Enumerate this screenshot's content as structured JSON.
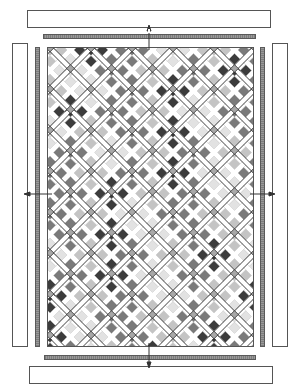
{
  "diagram": {
    "title": "",
    "type": "quilt-assembly-diagram",
    "layout": "on-point blocks with sashing and cornerstones, surrounded by inner strips and outer border panels",
    "components": {
      "top_border": {
        "label": ""
      },
      "bottom_border": {
        "label": ""
      },
      "left_border": {
        "label": ""
      },
      "right_border": {
        "label": ""
      },
      "top_inner_strip": {
        "label": ""
      },
      "bottom_inner_strip": {
        "label": ""
      },
      "left_inner_strip": {
        "label": ""
      },
      "right_inner_strip": {
        "label": ""
      },
      "quilt_center": {
        "label": ""
      }
    },
    "arrows": [
      "top",
      "bottom",
      "left",
      "right"
    ],
    "colors": {
      "outline": "#555555",
      "strip": "#8a8a8a",
      "sashing": "#ffffff",
      "cornerstone": "#a8a8a8",
      "dark": "#3c3c3c",
      "medium": "#7a7a7a",
      "light": "#c4c4c4",
      "pale": "#e2e2e2",
      "background": "#ffffff"
    },
    "block_shades": [
      "light",
      "medium",
      "pale",
      "light",
      "medium",
      "dark",
      "pale",
      "medium",
      "light",
      "dark",
      "medium",
      "pale",
      "light",
      "medium",
      "light",
      "dark",
      "pale",
      "medium",
      "light",
      "medium",
      "dark",
      "pale",
      "medium",
      "light",
      "pale",
      "medium",
      "dark",
      "light",
      "medium",
      "pale",
      "light",
      "dark",
      "medium",
      "light",
      "pale",
      "medium"
    ]
  }
}
